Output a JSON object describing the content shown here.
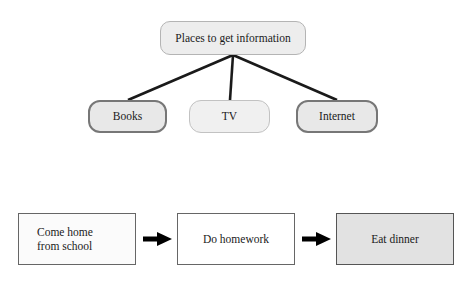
{
  "figure": {
    "background_color": "#ffffff",
    "text_color": "#1a1a1a"
  },
  "tree_diagram": {
    "name": "places-to-get-information-tree",
    "root": {
      "id": "root",
      "label": "Places to get information",
      "shape": "rounded-rectangle",
      "fill": "#ededed",
      "stroke": "#b4b4b4"
    },
    "children": [
      {
        "id": "books",
        "label": "Books",
        "shape": "rounded-rectangle",
        "fill": "#e8e8e8",
        "stroke": "#777777"
      },
      {
        "id": "tv",
        "label": "TV",
        "shape": "rounded-rectangle",
        "fill": "#f0f0f0",
        "stroke": "#c2c2c2"
      },
      {
        "id": "internet",
        "label": "Internet",
        "shape": "rounded-rectangle",
        "fill": "#e8e8e8",
        "stroke": "#777777"
      }
    ],
    "edges": [
      {
        "from": "root",
        "to": "books",
        "style": "straight-line",
        "color": "#1a1a1a"
      },
      {
        "from": "root",
        "to": "tv",
        "style": "straight-line",
        "color": "#1a1a1a"
      },
      {
        "from": "root",
        "to": "internet",
        "style": "straight-line",
        "color": "#1a1a1a"
      }
    ]
  },
  "flow_diagram": {
    "name": "after-school-sequence-flowchart",
    "steps": [
      {
        "id": "come-home",
        "label": "Come home\nfrom school",
        "shape": "rectangle",
        "fill": "#fbfbfb",
        "stroke": "#666666"
      },
      {
        "id": "do-homework",
        "label": "Do homework",
        "shape": "rectangle",
        "fill": "#ffffff",
        "stroke": "#666666"
      },
      {
        "id": "eat-dinner",
        "label": "Eat dinner",
        "shape": "rectangle",
        "fill": "#e2e2e2",
        "stroke": "#555555"
      }
    ],
    "connectors": [
      {
        "from": "come-home",
        "to": "do-homework",
        "style": "solid-arrow",
        "color": "#000000"
      },
      {
        "from": "do-homework",
        "to": "eat-dinner",
        "style": "solid-arrow",
        "color": "#000000"
      }
    ]
  }
}
